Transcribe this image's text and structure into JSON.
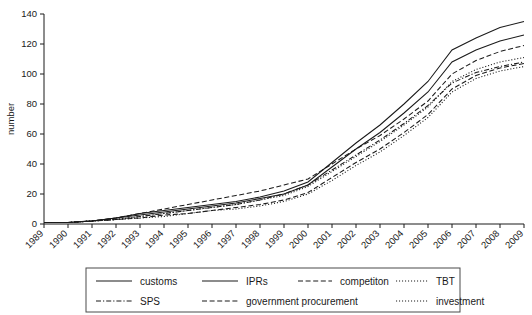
{
  "chart_data": {
    "type": "line",
    "title": "",
    "subtitle": "",
    "xlabel": "",
    "ylabel": "number",
    "ylim": [
      0,
      140
    ],
    "y_ticks": [
      0,
      20,
      40,
      60,
      80,
      100,
      120,
      140
    ],
    "grid": false,
    "legend_position": "bottom",
    "x_tick_rotation": 45,
    "x": [
      "1989",
      "1990",
      "1991",
      "1992",
      "1993",
      "1994",
      "1995",
      "1996",
      "1997",
      "1998",
      "1999",
      "2000",
      "2001",
      "2002",
      "2003",
      "2004",
      "2005",
      "2006",
      "2007",
      "2008",
      "2009"
    ],
    "categories": [
      "1989",
      "1990",
      "1991",
      "1992",
      "1993",
      "1994",
      "1995",
      "1996",
      "1997",
      "1998",
      "1999",
      "2000",
      "2001",
      "2002",
      "2003",
      "2004",
      "2005",
      "2006",
      "2007",
      "2008",
      "2009"
    ],
    "series": [
      {
        "name": "customs",
        "line_style": "solid",
        "values": [
          1,
          1,
          2,
          4,
          7,
          9,
          11,
          13,
          15,
          18,
          22,
          28,
          41,
          54,
          66,
          80,
          95,
          116,
          124,
          131,
          135
        ]
      },
      {
        "name": "IPRs",
        "line_style": "solid",
        "values": [
          1,
          1,
          2,
          4,
          6,
          8,
          10,
          12,
          14,
          17,
          20,
          26,
          38,
          50,
          61,
          74,
          88,
          108,
          116,
          122,
          126
        ]
      },
      {
        "name": "competiton",
        "line_style": "dashed",
        "values": [
          1,
          1,
          2,
          4,
          7,
          10,
          13,
          16,
          19,
          22,
          26,
          30,
          40,
          50,
          59,
          70,
          82,
          100,
          109,
          115,
          119
        ]
      },
      {
        "name": "TBT",
        "line_style": "dotted",
        "values": [
          1,
          1,
          2,
          3,
          5,
          7,
          9,
          11,
          13,
          16,
          19,
          25,
          35,
          45,
          55,
          66,
          78,
          95,
          103,
          108,
          111
        ]
      },
      {
        "name": "SPS",
        "line_style": "dash-dot",
        "values": [
          1,
          1,
          2,
          3,
          5,
          7,
          9,
          11,
          13,
          16,
          20,
          26,
          36,
          46,
          56,
          67,
          79,
          94,
          101,
          105,
          108
        ]
      },
      {
        "name": "government procurement",
        "line_style": "dashed",
        "values": [
          1,
          1,
          2,
          3,
          4,
          6,
          7,
          9,
          11,
          13,
          16,
          21,
          31,
          41,
          50,
          61,
          73,
          90,
          99,
          104,
          107
        ]
      },
      {
        "name": "investment",
        "line_style": "dotted",
        "values": [
          1,
          1,
          2,
          3,
          4,
          5,
          7,
          9,
          10,
          12,
          15,
          20,
          29,
          39,
          48,
          59,
          71,
          88,
          97,
          102,
          105
        ]
      }
    ]
  },
  "axis": {
    "y_title": "number",
    "y_tick_labels": [
      "0",
      "20",
      "40",
      "60",
      "80",
      "100",
      "120",
      "140"
    ],
    "x_tick_labels": [
      "1989",
      "1990",
      "1991",
      "1992",
      "1993",
      "1994",
      "1995",
      "1996",
      "1997",
      "1998",
      "1999",
      "2000",
      "2001",
      "2002",
      "2003",
      "2004",
      "2005",
      "2006",
      "2007",
      "2008",
      "2009"
    ]
  },
  "legend": {
    "entries": [
      {
        "label": "customs",
        "style": "solid"
      },
      {
        "label": "IPRs",
        "style": "solid"
      },
      {
        "label": "competiton",
        "style": "dashed"
      },
      {
        "label": "TBT",
        "style": "dotted"
      },
      {
        "label": "SPS",
        "style": "dash-dot"
      },
      {
        "label": "government procurement",
        "style": "dashed"
      },
      {
        "label": "investment",
        "style": "dotted"
      }
    ]
  },
  "colors": {
    "ink": "#1a1a1a",
    "legend_border": "#4a4a4a",
    "background": "#ffffff"
  }
}
